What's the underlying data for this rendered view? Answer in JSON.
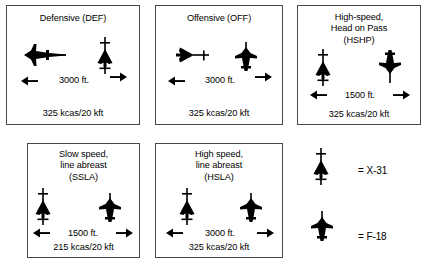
{
  "figure": {
    "background_color": "#ffffff",
    "ink_color": "#000000",
    "border_color": "#4a4a4a"
  },
  "panels": [
    {
      "id": "defensive",
      "title": "Defensive (DEF)",
      "distance": "3000 ft.",
      "footer": "325 kcas/20 kft",
      "left_aircraft": "F-18",
      "right_aircraft": "X-31",
      "left_arrow": "arrow-left",
      "right_arrow": "arrow-right"
    },
    {
      "id": "offensive",
      "title": "Offensive (OFF)",
      "distance": "3000 ft.",
      "footer": "325 kcas/20 kft",
      "left_aircraft": "X-31",
      "right_aircraft": "F-18",
      "left_arrow": "arrow-left",
      "right_arrow": "arrow-right"
    },
    {
      "id": "hshp",
      "title": "High-speed,\nHead on Pass\n(HSHP)",
      "distance": "1500 ft.",
      "footer": "325 kcas/20 kft",
      "left_aircraft": "X-31",
      "right_aircraft": "F-18",
      "left_arrow": "arrow-left",
      "right_arrow": "arrow-right"
    },
    {
      "id": "ssla",
      "title": "Slow speed,\nline abreast\n(SSLA)",
      "distance": "1500 ft.",
      "footer": "215 kcas/20 kft",
      "left_aircraft": "X-31",
      "right_aircraft": "F-18",
      "left_arrow": "arrow-left",
      "right_arrow": "arrow-right"
    },
    {
      "id": "hsla",
      "title": "High speed,\nline abreast\n(HSLA)",
      "distance": "3000 ft.",
      "footer": "325 kcas/20 kft",
      "left_aircraft": "X-31",
      "right_aircraft": "F-18",
      "left_arrow": "arrow-left",
      "right_arrow": "arrow-right"
    }
  ],
  "legend": {
    "items": [
      {
        "symbol": "x31-aircraft-icon",
        "label": "= X-31"
      },
      {
        "symbol": "f18-aircraft-icon",
        "label": "= F-18"
      }
    ]
  }
}
